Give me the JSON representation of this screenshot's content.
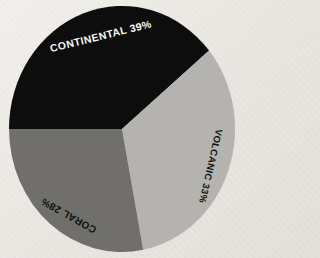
{
  "colors": {
    "background": "#eae7e2",
    "slice_black": "#0d0d0d",
    "slice_light_gray": "#b5b3af",
    "slice_dark_gray": "#716f6c"
  },
  "chart_data": {
    "type": "pie",
    "title": "",
    "unit": "%",
    "start_angle_deg": 180,
    "direction": "clockwise",
    "legend": "none",
    "labels_on_slices": true,
    "categories": [
      "CONTINENTAL",
      "VOLCANIC",
      "CORAL"
    ],
    "values": [
      39,
      33,
      28
    ],
    "slices": [
      {
        "label": "CONTINENTAL",
        "value": 39,
        "display": "CONTINENTAL 39%",
        "color": "#0d0d0d",
        "text_color": "#f6f6f6"
      },
      {
        "label": "VOLCANIC",
        "value": 33,
        "display": "VOLCANIC 33%",
        "color": "#b5b3af",
        "text_color": "#121212"
      },
      {
        "label": "CORAL",
        "value": 28,
        "display": "CORAL 28%",
        "color": "#716f6c",
        "text_color": "#0f0f0f"
      }
    ]
  }
}
